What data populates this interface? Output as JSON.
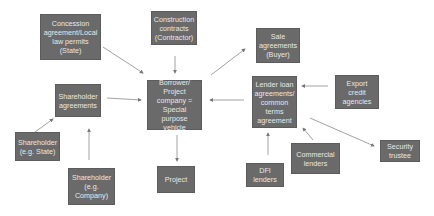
{
  "diagram": {
    "type": "project-finance-structure",
    "colors": {
      "node_fill": "#6a6a6a",
      "node_text": "#e8e8e8",
      "arrow": "#8a8a8a",
      "background": "#ffffff"
    },
    "nodes": [
      {
        "id": "concession",
        "label": "Concession\nagreement/Local\nlaw permits\n(State)"
      },
      {
        "id": "construction",
        "label": "Construction\ncontracts\n(Contractor)"
      },
      {
        "id": "sale",
        "label": "Sale\nagreements\n(Buyer)"
      },
      {
        "id": "shareholder_agreements",
        "label": "Shareholder\nagreements"
      },
      {
        "id": "borrower",
        "label": "Borrower/\nProject\ncompany =\nSpecial purpose\nvehicle"
      },
      {
        "id": "lender",
        "label": "Lender loan\nagreements/\ncommon\nterms\nagreement"
      },
      {
        "id": "export",
        "label": "Export\ncredit\nagencies"
      },
      {
        "id": "shareholder_state",
        "label": "Shareholder\n(e.g. State)"
      },
      {
        "id": "shareholder_company",
        "label": "Shareholder\n(e.g. Company)"
      },
      {
        "id": "project",
        "label": "Project"
      },
      {
        "id": "dfi",
        "label": "DFI\nlenders"
      },
      {
        "id": "commercial",
        "label": "Commercial\nlenders"
      },
      {
        "id": "security",
        "label": "Security\ntrustee"
      }
    ],
    "edges": [
      {
        "from": "concession",
        "to": "borrower"
      },
      {
        "from": "construction",
        "to": "borrower"
      },
      {
        "from": "borrower",
        "to": "sale"
      },
      {
        "from": "shareholder_agreements",
        "to": "borrower"
      },
      {
        "from": "lender",
        "to": "borrower"
      },
      {
        "from": "export",
        "to": "lender"
      },
      {
        "from": "shareholder_state",
        "to": "shareholder_agreements"
      },
      {
        "from": "shareholder_company",
        "to": "shareholder_agreements"
      },
      {
        "from": "borrower",
        "to": "project"
      },
      {
        "from": "dfi",
        "to": "lender"
      },
      {
        "from": "commercial",
        "to": "lender"
      },
      {
        "from": "lender",
        "to": "security"
      }
    ]
  }
}
